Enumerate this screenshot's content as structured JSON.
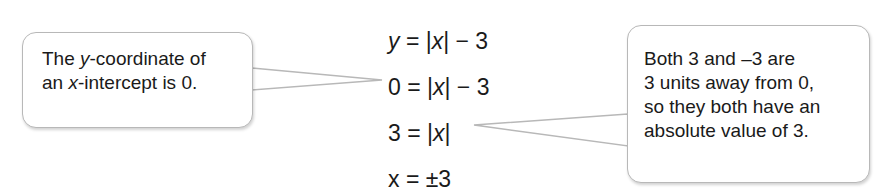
{
  "left_note": {
    "lines": [
      "The y-coordinate of",
      "an x-intercept is 0."
    ]
  },
  "equations": [
    "y = |x| − 3",
    "0 = |x| − 3",
    "3 = |x|",
    "x = ±3"
  ],
  "right_note": {
    "lines": [
      "Both 3 and –3 are",
      "3 units away from 0,",
      "so they both have an",
      "absolute value of 3."
    ]
  }
}
